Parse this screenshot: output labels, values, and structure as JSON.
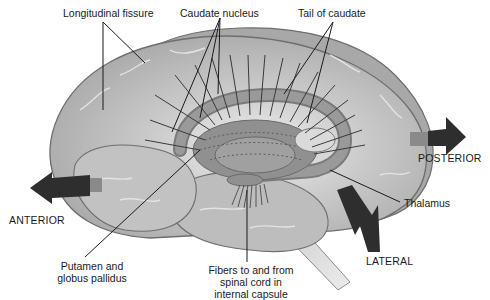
{
  "diagram": {
    "type": "anatomical-illustration",
    "colors": {
      "background": "#ffffff",
      "brain_fill": "#b8b8b8",
      "brain_light": "#d6d6d6",
      "brain_outline": "#6e6e6e",
      "caudate_fill": "#8c8c8c",
      "arrow": "#2e2e2e",
      "arrow_base": "#8a8a8a",
      "leader_line": "#1a1a1a",
      "text": "#1a1a1a",
      "spinal_cord": "#d8d8d8"
    }
  },
  "labels": {
    "longitudinal_fissure": "Longitudinal fissure",
    "caudate_nucleus": "Caudate nucleus",
    "tail_of_caudate": "Tail of caudate",
    "posterior": "POSTERIOR",
    "thalamus": "Thalamus",
    "anterior": "ANTERIOR",
    "lateral": "LATERAL",
    "putamen_line1": "Putamen and",
    "putamen_line2": "globus pallidus",
    "fibers_line1": "Fibers to and from",
    "fibers_line2": "spinal cord in",
    "fibers_line3": "internal capsule"
  }
}
